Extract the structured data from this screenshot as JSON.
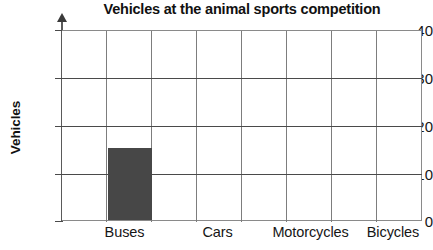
{
  "chart_data": {
    "type": "bar",
    "title": "Vehicles at the animal sports competition",
    "xlabel": "",
    "ylabel": "Vehicles",
    "categories": [
      "Buses",
      "Cars",
      "Motorcycles",
      "Bicycles"
    ],
    "values": [
      15,
      0,
      0,
      0
    ],
    "ylim": [
      0,
      40
    ],
    "yticks": [
      0,
      10,
      20,
      30,
      40
    ],
    "ytick_labels": [
      "0",
      "10",
      "20",
      "30",
      "40"
    ],
    "grid": true,
    "legend": null,
    "series": [
      {
        "name": "Vehicles",
        "values": [
          15,
          0,
          0,
          0
        ]
      }
    ],
    "colors": {
      "bar": "#474747",
      "grid": "#7d7d7d",
      "axis": "#4a4a4a",
      "text": "#161616",
      "background": "#ffffff"
    }
  }
}
